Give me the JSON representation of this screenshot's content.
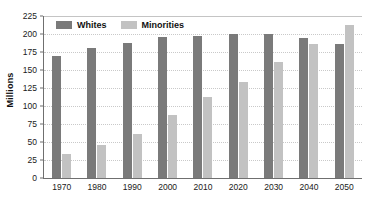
{
  "chart_data": {
    "type": "bar",
    "title": "",
    "subtitle": "",
    "xlabel": "",
    "ylabel": "Millions",
    "categories": [
      "1970",
      "1980",
      "1990",
      "2000",
      "2010",
      "2020",
      "2030",
      "2040",
      "2050"
    ],
    "series": [
      {
        "name": "Whites",
        "color": "#7a7a7a",
        "values": [
          170,
          180,
          188,
          196,
          197,
          200,
          200,
          194,
          186
        ]
      },
      {
        "name": "Minorities",
        "color": "#c2c2c2",
        "values": [
          34,
          46,
          61,
          87,
          112,
          134,
          161,
          186,
          212
        ]
      }
    ],
    "ylim": [
      0,
      225
    ],
    "ytick_step": 25,
    "yticks": [
      0,
      25,
      50,
      75,
      100,
      125,
      150,
      175,
      200,
      225
    ],
    "ytick_labels": [
      "0",
      "25",
      "50",
      "75",
      "100",
      "125",
      "150",
      "175",
      "200",
      "225"
    ],
    "grid": true,
    "grid_axis": "y",
    "grid_style": "dotted",
    "legend_position": "top-left-inside",
    "background_color": "#ffffff",
    "axis_color": "#6f6f6f",
    "gridline_color": "#c9c9c9"
  }
}
